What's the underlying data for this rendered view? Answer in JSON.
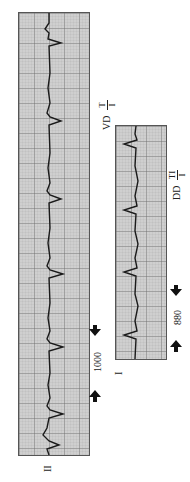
{
  "figure": {
    "strip_ii": {
      "lead_label": "II",
      "interval_label": "1000",
      "annotation_prefix": "VD",
      "annotation_num": "T",
      "annotation_den": "I"
    },
    "strip_i": {
      "lead_label": "I",
      "interval_label": "880",
      "annotation_prefix": "DD",
      "annotation_num": "TI",
      "annotation_den": "I"
    },
    "colors": {
      "grid_bg": "#cfcfcf",
      "grid_line": "#7a7a7a",
      "trace": "#1a1a1a"
    }
  }
}
